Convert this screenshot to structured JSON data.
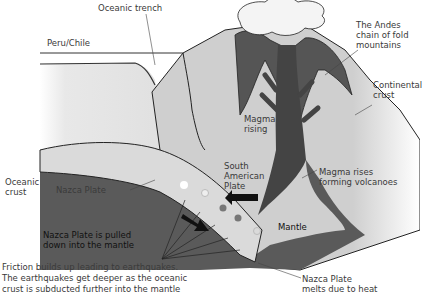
{
  "labels": {
    "oceanic_trench": "Oceanic trench",
    "peru_chile": "Peru/Chile",
    "andes": [
      "The Andes",
      "chain of fold",
      "mountains"
    ],
    "continental_crust": [
      "Continental",
      "crust"
    ],
    "magma_rising": [
      "Magma",
      "rising"
    ],
    "oceanic_crust": [
      "Oceanic",
      "crust"
    ],
    "nazca_plate": "Nazca Plate",
    "south_american_plate": [
      "South",
      "American",
      "Plate"
    ],
    "magma_rises_volcanoes": [
      "Magma rises",
      "forming volcanoes"
    ],
    "pulled_down": [
      "Nazca Plate is pulled",
      "down into the mantle"
    ],
    "mantle": "Mantle",
    "friction": [
      "Friction builds up leading to earthquakes.",
      "The earthquakes get deeper as the oceanic",
      "crust is subducted further into the mantle"
    ],
    "melts": [
      "Nazca Plate",
      "melts due to heat"
    ]
  },
  "colors": {
    "ocean": "#e4e4e4",
    "mantle": "#5a5a5a",
    "plate": "#d8d8d8",
    "continent": "#cfcfcf",
    "magma": "#4a4a4a",
    "ash": "#f4f4f4",
    "line": "#222222"
  }
}
